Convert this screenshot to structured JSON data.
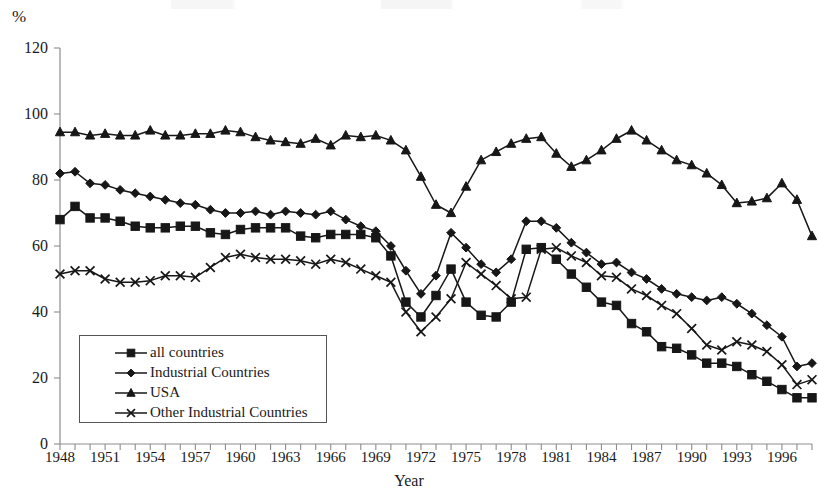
{
  "chart_data": {
    "type": "line",
    "title": "",
    "xlabel": "Year",
    "ylabel": "%",
    "ylim": [
      0,
      120
    ],
    "ytick_step": 20,
    "yticks": [
      0,
      20,
      40,
      60,
      80,
      100,
      120
    ],
    "xlim": [
      1948,
      1998
    ],
    "xticks_labeled": [
      1948,
      1951,
      1954,
      1957,
      1960,
      1963,
      1966,
      1969,
      1972,
      1975,
      1978,
      1981,
      1984,
      1987,
      1990,
      1993,
      1996
    ],
    "xtick_interval_labeled": 3,
    "grid": false,
    "legend_position": "inside-lower-left",
    "x": [
      1948,
      1949,
      1950,
      1951,
      1952,
      1953,
      1954,
      1955,
      1956,
      1957,
      1958,
      1959,
      1960,
      1961,
      1962,
      1963,
      1964,
      1965,
      1966,
      1967,
      1968,
      1969,
      1970,
      1971,
      1972,
      1973,
      1974,
      1975,
      1976,
      1977,
      1978,
      1979,
      1980,
      1981,
      1982,
      1983,
      1984,
      1985,
      1986,
      1987,
      1988,
      1989,
      1990,
      1991,
      1992,
      1993,
      1994,
      1995,
      1996,
      1997,
      1998
    ],
    "series": [
      {
        "name": "all countries",
        "marker": "square",
        "values": [
          68,
          72,
          68.5,
          68.5,
          67.5,
          66,
          65.5,
          65.5,
          66,
          66,
          64,
          63.5,
          65,
          65.5,
          65.5,
          65.5,
          63,
          62.5,
          63.5,
          63.5,
          63.5,
          62.5,
          57,
          43,
          38.5,
          45,
          53,
          43,
          39,
          38.5,
          43,
          59,
          59.5,
          56,
          51.5,
          47.5,
          43,
          42,
          36.5,
          34,
          29.5,
          29,
          27,
          24.5,
          24.5,
          23.5,
          21,
          19,
          16.5,
          14,
          14
        ]
      },
      {
        "name": "Industrial Countries",
        "marker": "diamond",
        "values": [
          82,
          82.5,
          79,
          78.5,
          77,
          76,
          75,
          74,
          73,
          72.5,
          71,
          70,
          70,
          70.5,
          69.5,
          70.5,
          70,
          69.5,
          70.5,
          68,
          66,
          64.5,
          60,
          52.5,
          45.5,
          51,
          64,
          59.5,
          54.5,
          52,
          56,
          67.5,
          67.5,
          65.5,
          61,
          58,
          54.5,
          55,
          52,
          50,
          47,
          45.5,
          44.5,
          43.5,
          44.5,
          42.5,
          39.5,
          36,
          32.5,
          23.5,
          24.5
        ]
      },
      {
        "name": "USA",
        "marker": "triangle",
        "values": [
          94.5,
          94.5,
          93.5,
          94,
          93.5,
          93.5,
          95,
          93.5,
          93.5,
          94,
          94,
          95,
          94.5,
          93,
          92,
          91.5,
          91,
          92.5,
          90.5,
          93.5,
          93,
          93.5,
          92,
          89,
          81,
          72.5,
          70,
          78,
          86,
          88.5,
          91,
          92.5,
          93,
          88,
          84,
          86,
          89,
          92.5,
          95,
          92,
          89,
          86,
          84.5,
          82,
          78.5,
          73,
          73.5,
          74.5,
          79,
          74,
          63
        ]
      },
      {
        "name": "Other Industrial Countries",
        "marker": "cross",
        "values": [
          51.5,
          52.5,
          52.5,
          50,
          49,
          49,
          49.5,
          51,
          51,
          50.5,
          53.5,
          56.5,
          57.5,
          56.5,
          56,
          56,
          55.5,
          54.5,
          56,
          55,
          53,
          51,
          49,
          40,
          34,
          38.5,
          44,
          55,
          51.5,
          48,
          44,
          44.5,
          59,
          59.5,
          57,
          55,
          51,
          50.5,
          47,
          45,
          42,
          39.5,
          35,
          30,
          28.5,
          31,
          30,
          28,
          24,
          18,
          19.5
        ]
      }
    ],
    "usa_tail_note": "",
    "usa_right_tail": [
      63,
      62,
      59,
      59.5,
      59,
      62,
      61,
      61.5,
      57,
      52.5
    ]
  },
  "legend": {
    "items": [
      {
        "label": "all countries",
        "marker": "square"
      },
      {
        "label": "Industrial Countries",
        "marker": "diamond"
      },
      {
        "label": "USA",
        "marker": "triangle"
      },
      {
        "label": "Other Industrial Countries",
        "marker": "cross"
      }
    ]
  },
  "axes": {
    "y_unit": "%",
    "x_title": "Year"
  },
  "colors": {
    "ink": "#171717",
    "axis": "#8d8d8d",
    "background": "#ffffff"
  }
}
